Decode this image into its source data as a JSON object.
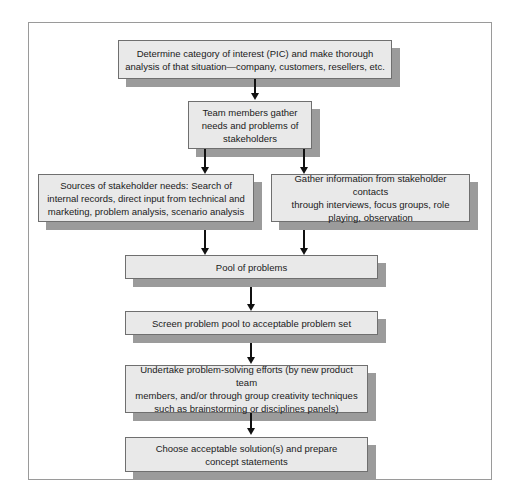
{
  "figure": {
    "frame_color": "#9a9a9a",
    "box_fill": "#e9e9e9",
    "box_border": "#6f6f6f",
    "shadow_color": "#9b9b9b",
    "connector_color": "#111111",
    "background": "#ffffff"
  },
  "nodes": [
    {
      "id": "determine-category",
      "text": "Determine category of interest (PIC) and make thorough\nanalysis of that situation—company, customers, resellers, etc."
    },
    {
      "id": "team-members-gather",
      "text": "Team members gather\nneeds and problems of\nstakeholders"
    },
    {
      "id": "sources-of-needs",
      "text": "Sources of stakeholder needs: Search of\ninternal records, direct input from technical and\nmarketing, problem analysis, scenario analysis"
    },
    {
      "id": "gather-information",
      "text": "Gather information from stakeholder contacts\nthrough interviews, focus groups, role\nplaying, observation"
    },
    {
      "id": "pool-of-problems",
      "text": "Pool of problems"
    },
    {
      "id": "screen-problem-pool",
      "text": "Screen problem pool to acceptable problem set"
    },
    {
      "id": "undertake-problem-solving",
      "text": "Undertake problem-solving efforts (by new product team\nmembers, and/or through group creativity techniques\nsuch as brainstorming or disciplines panels)"
    },
    {
      "id": "choose-solutions",
      "text": "Choose acceptable solution(s) and prepare\nconcept statements"
    }
  ],
  "connectors": [
    {
      "id": "determine-to-team",
      "from": "determine-category",
      "to": "team-members-gather"
    },
    {
      "id": "team-to-sources",
      "from": "team-members-gather",
      "to": "sources-of-needs"
    },
    {
      "id": "team-to-gather",
      "from": "team-members-gather",
      "to": "gather-information"
    },
    {
      "id": "sources-to-pool",
      "from": "sources-of-needs",
      "to": "pool-of-problems"
    },
    {
      "id": "gather-to-pool",
      "from": "gather-information",
      "to": "pool-of-problems"
    },
    {
      "id": "pool-to-screen",
      "from": "pool-of-problems",
      "to": "screen-problem-pool"
    },
    {
      "id": "screen-to-undertake",
      "from": "screen-problem-pool",
      "to": "undertake-problem-solving"
    },
    {
      "id": "undertake-to-choose",
      "from": "undertake-problem-solving",
      "to": "choose-solutions"
    }
  ]
}
